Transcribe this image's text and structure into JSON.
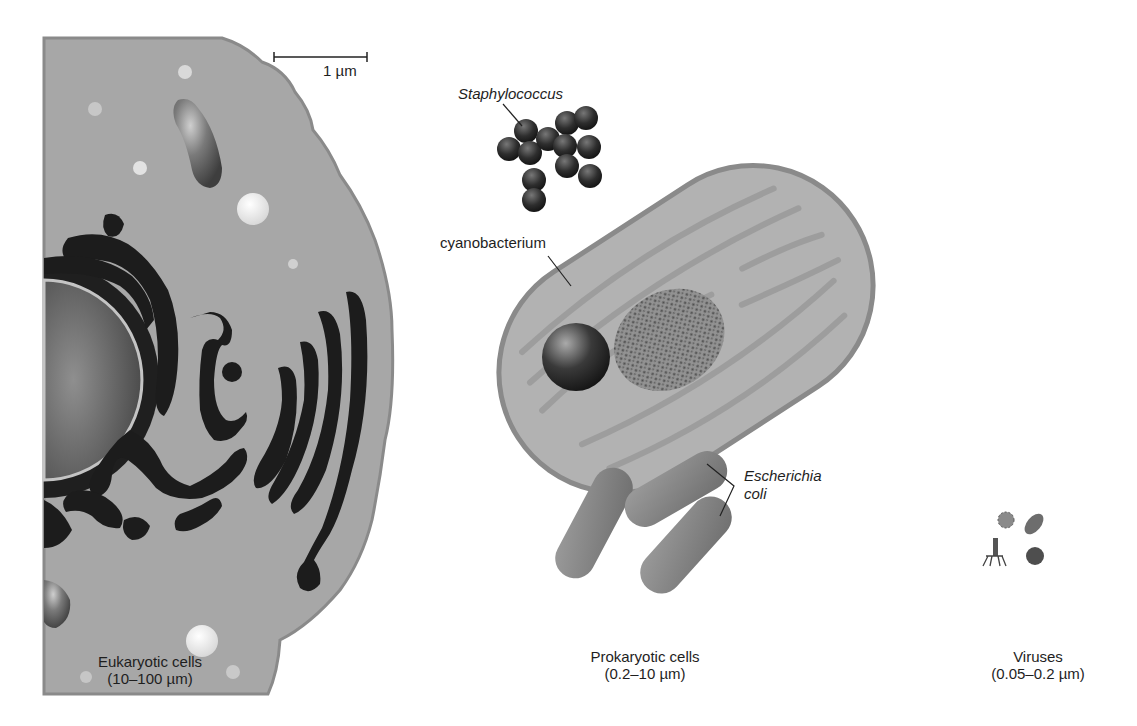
{
  "figure": {
    "scale_bar": {
      "label": "1 µm"
    },
    "labels": {
      "staphylococcus": "Staphylococcus",
      "cyanobacterium": "cyanobacterium",
      "escherichia_line1": "Escherichia",
      "escherichia_line2": "coli"
    },
    "categories": [
      {
        "name": "Eukaryotic cells",
        "range": "(10–100 µm)"
      },
      {
        "name": "Prokaryotic cells",
        "range": "(0.2–10 µm)"
      },
      {
        "name": "Viruses",
        "range": "(0.05–0.2 µm)"
      }
    ],
    "colors": {
      "background": "#ffffff",
      "cytoplasm": "#a9a9a9",
      "membrane": "#8a8a8a",
      "organelle_dark": "#1c1c1c",
      "cyanobacterium_fill": "#b3b3b3",
      "staph_cocci": "#2b2b2b",
      "ecoli": "#8c8c8c"
    }
  }
}
